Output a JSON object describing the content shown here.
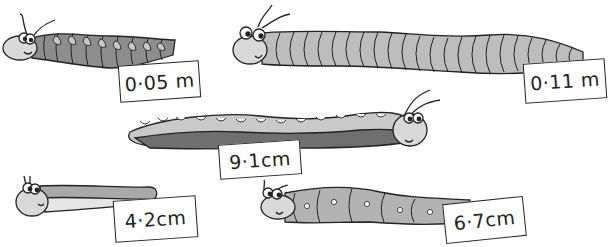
{
  "illustration": {
    "description": "Five cartoon caterpillars / millipedes, each tagged with a length label",
    "creatures": [
      {
        "id": "top-left",
        "label": "0·05 m",
        "body_color": "#8d8d8d",
        "style": "dark segmented with light spots"
      },
      {
        "id": "top-right",
        "label": "0·11 m",
        "body_color": "#bdbdbd",
        "style": "long light-grey segmented millipede"
      },
      {
        "id": "middle",
        "label": "9·1cm",
        "body_color": "#c9c9c9",
        "belly_color": "#6f6f6f",
        "style": "two-tone long caterpillar"
      },
      {
        "id": "bottom-left",
        "label": "4·2cm",
        "body_color": "#a9a9a9",
        "style": "slug-like caterpillar"
      },
      {
        "id": "bottom-right",
        "label": "6·7cm",
        "body_color": "#b3b3b3",
        "style": "segmented with white dots"
      }
    ]
  },
  "colors": {
    "outline": "#222222",
    "background": "#ffffff",
    "face": "#d9d9d9"
  }
}
